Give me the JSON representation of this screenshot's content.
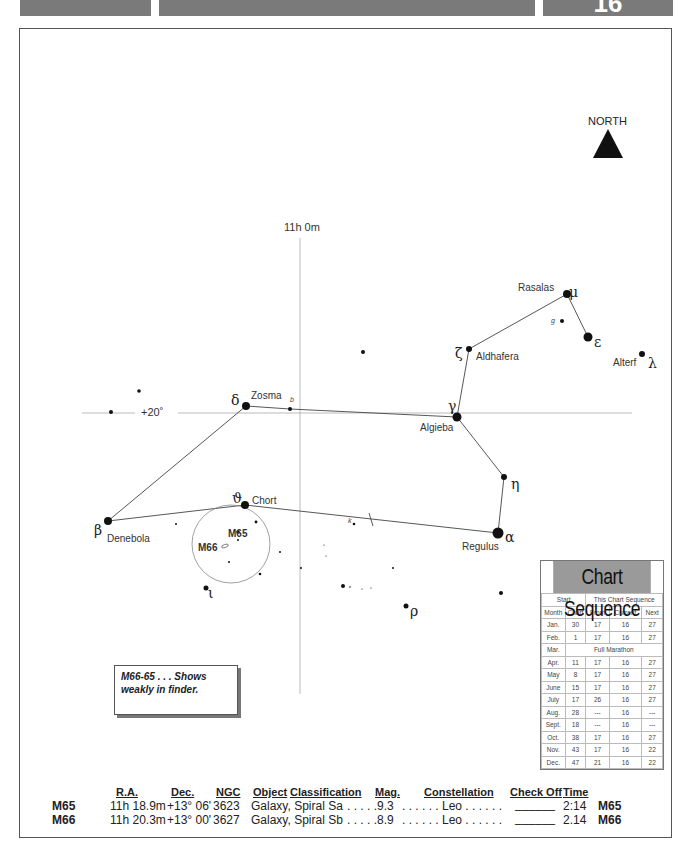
{
  "header": {
    "page_number": "16"
  },
  "compass": {
    "label": "NORTH"
  },
  "grid": {
    "ra_label": "11h 0m",
    "dec_label": "+20˚"
  },
  "stars": {
    "delta": {
      "greek": "δ",
      "name": "Zosma"
    },
    "b": {
      "greek": "b"
    },
    "gamma": {
      "greek": "γ",
      "name": "Algieba"
    },
    "zeta": {
      "greek": "ζ",
      "name": "Aldhafera"
    },
    "mu": {
      "greek": "μ",
      "name": "Rasalas"
    },
    "g": {
      "greek": "g"
    },
    "epsilon": {
      "greek": "ε"
    },
    "lambda": {
      "greek": "λ",
      "name": "Alterf"
    },
    "eta": {
      "greek": "η"
    },
    "alpha": {
      "greek": "α",
      "name": "Regulus"
    },
    "beta": {
      "greek": "β",
      "name": "Denebola"
    },
    "theta": {
      "greek": "ϑ",
      "name": "Chort"
    },
    "iota": {
      "greek": "ι"
    },
    "rho": {
      "greek": "ρ"
    },
    "k": {
      "greek": "k"
    }
  },
  "objects": {
    "m65": "M65",
    "m66": "M66"
  },
  "note": {
    "text": "M66-65 . . . Shows weakly in finder."
  },
  "chart_sequence": {
    "title": "Chart Sequence",
    "group_headers": [
      "Start",
      "This Chart Sequence"
    ],
    "columns": [
      "Month",
      "Chart",
      "From",
      "Current",
      "Next"
    ],
    "rows": [
      [
        "Jan.",
        "30",
        "17",
        "16",
        "27"
      ],
      [
        "Feb.",
        "1",
        "17",
        "16",
        "27"
      ],
      [
        "Mar.",
        "Full Marathon"
      ],
      [
        "Apr.",
        "11",
        "17",
        "16",
        "27"
      ],
      [
        "May",
        "8",
        "17",
        "16",
        "27"
      ],
      [
        "June",
        "15",
        "17",
        "16",
        "27"
      ],
      [
        "July",
        "17",
        "26",
        "16",
        "27"
      ],
      [
        "Aug.",
        "28",
        "---",
        "16",
        "---"
      ],
      [
        "Sept.",
        "18",
        "---",
        "16",
        "---"
      ],
      [
        "Oct.",
        "38",
        "17",
        "16",
        "27"
      ],
      [
        "Nov.",
        "43",
        "17",
        "16",
        "22"
      ],
      [
        "Dec.",
        "47",
        "21",
        "16",
        "22"
      ]
    ]
  },
  "catalog": {
    "headers": {
      "ra": "R.A.",
      "dec": "Dec.",
      "ngc": "NGC",
      "object": "Object",
      "classification": "Classification",
      "mag": "Mag.",
      "constellation": "Constellation",
      "check_off": "Check Off",
      "time": "Time"
    },
    "rows": [
      {
        "id": "M65",
        "ra": "11h 18.9m",
        "dec": "+13° 06'",
        "ngc": "3623",
        "object": "Galaxy, Spiral Sa",
        "mag": ". . . . .9.3",
        "constellation": ". . . . . . Leo . . . . . .",
        "check_off": "______",
        "time": "2:14",
        "id_end": "M65"
      },
      {
        "id": "M66",
        "ra": "11h 20.3m",
        "dec": "+13° 00'",
        "ngc": "3627",
        "object": "Galaxy, Spiral Sb",
        "mag": ". . . . .8.9",
        "constellation": ". . . . . . Leo . . . . . .",
        "check_off": "______",
        "time": "2.14",
        "id_end": "M66"
      }
    ]
  }
}
